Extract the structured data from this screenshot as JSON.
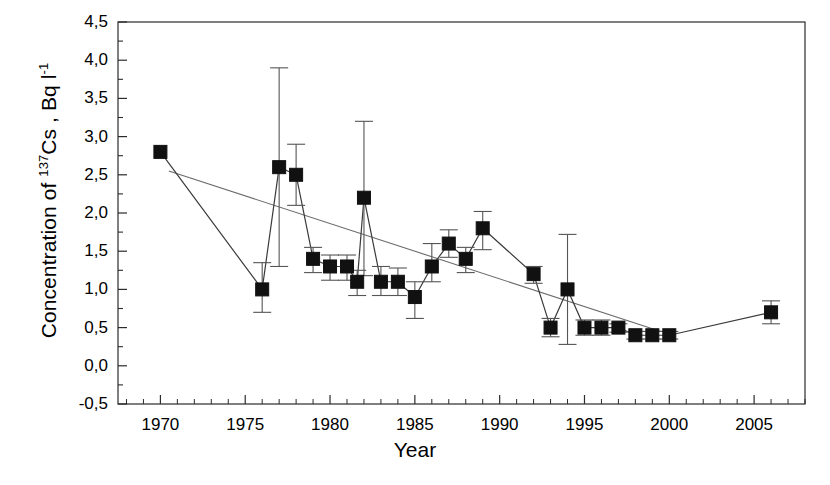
{
  "chart_data": {
    "type": "line",
    "title": "",
    "xlabel": "Year",
    "ylabel_plain": "Concentration of 137Cs , Bq l-1",
    "ylabel_parts": {
      "prefix": "Concentration of ",
      "isotope_sup": "137",
      "element": "Cs , Bq l",
      "unit_sup": "-1"
    },
    "xlim": [
      1967.5,
      2008.0
    ],
    "ylim": [
      -0.5,
      4.5
    ],
    "xticks": [
      1970,
      1975,
      1980,
      1985,
      1990,
      1995,
      2000,
      2005
    ],
    "xtick_labels": [
      "1970",
      "1975",
      "1980",
      "1985",
      "1990",
      "1995",
      "2000",
      "2005"
    ],
    "yticks": [
      -0.5,
      0.0,
      0.5,
      1.0,
      1.5,
      2.0,
      2.5,
      3.0,
      3.5,
      4.0,
      4.5
    ],
    "ytick_labels": [
      "-0,5",
      "0,0",
      "0,5",
      "1,0",
      "1,5",
      "2,0",
      "2,5",
      "3,0",
      "3,5",
      "4,0",
      "4,5"
    ],
    "minor_tick_interval_y": 0.25,
    "minor_tick_interval_x": 1,
    "grid": false,
    "legend": null,
    "decimal_separator": ",",
    "marker": "filled-square",
    "series": [
      {
        "name": "Concentration of 137Cs",
        "x": [
          1970,
          1976,
          1977,
          1978,
          1979,
          1980,
          1981,
          1981.6,
          1982,
          1983,
          1984,
          1985,
          1986,
          1987,
          1988,
          1989,
          1992,
          1993,
          1994,
          1995,
          1996,
          1997,
          1998,
          1999,
          2000,
          2006
        ],
        "values": [
          2.8,
          1.0,
          2.6,
          2.5,
          1.4,
          1.3,
          1.3,
          1.1,
          2.2,
          1.1,
          1.1,
          0.9,
          1.3,
          1.6,
          1.4,
          1.8,
          1.2,
          0.5,
          1.0,
          0.5,
          0.5,
          0.5,
          0.4,
          0.4,
          0.4,
          0.7
        ],
        "err_low": [
          null,
          0.7,
          1.3,
          2.1,
          1.22,
          1.12,
          1.12,
          0.92,
          1.18,
          0.92,
          0.92,
          0.62,
          1.1,
          1.42,
          1.22,
          1.52,
          1.08,
          0.38,
          0.28,
          0.4,
          0.4,
          0.44,
          0.35,
          0.35,
          0.35,
          0.55
        ],
        "err_high": [
          null,
          1.35,
          3.9,
          2.9,
          1.55,
          1.45,
          1.45,
          1.25,
          3.2,
          1.3,
          1.28,
          1.1,
          1.6,
          1.78,
          1.55,
          2.02,
          1.3,
          0.62,
          1.72,
          0.6,
          0.6,
          0.55,
          0.45,
          0.45,
          0.45,
          0.85
        ]
      }
    ],
    "trend_line": {
      "name": "linear regression",
      "x": [
        1970.5,
        1999.5
      ],
      "y": [
        2.55,
        0.45
      ]
    }
  }
}
